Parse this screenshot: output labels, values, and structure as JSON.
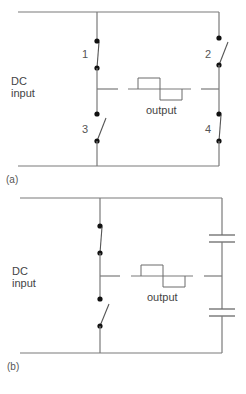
{
  "diagram_a": {
    "caption": "(a)",
    "input_label_line1": "DC",
    "input_label_line2": "input",
    "output_label": "output",
    "switches": [
      {
        "id": "1",
        "label": "1",
        "state": "closed"
      },
      {
        "id": "2",
        "label": "2",
        "state": "open"
      },
      {
        "id": "3",
        "label": "3",
        "state": "open"
      },
      {
        "id": "4",
        "label": "4",
        "state": "closed"
      }
    ],
    "topology": "full-bridge inverter"
  },
  "diagram_b": {
    "caption": "(b)",
    "input_label_line1": "DC",
    "input_label_line2": "input",
    "output_label": "output",
    "switches": [
      {
        "id": "upper",
        "state": "closed"
      },
      {
        "id": "lower",
        "state": "open"
      }
    ],
    "capacitors": [
      {
        "id": "upper-capacitor"
      },
      {
        "id": "lower-capacitor"
      }
    ],
    "topology": "half-bridge inverter"
  },
  "colors": {
    "wire": "#7a7a7a",
    "contact": "#111111",
    "text": "#444444"
  }
}
